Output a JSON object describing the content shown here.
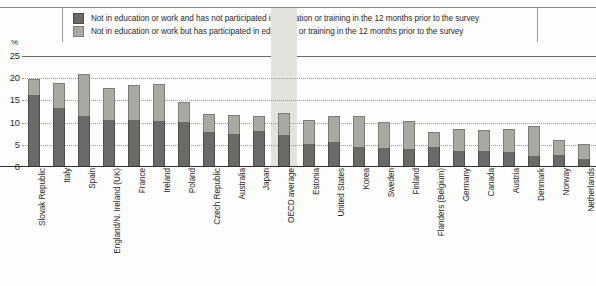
{
  "chart_data": {
    "type": "bar",
    "stacked": true,
    "title": "",
    "subtitle": "",
    "xlabel": "",
    "ylabel": "%",
    "ylim": [
      0,
      25
    ],
    "yticks": [
      0,
      5,
      10,
      15,
      20,
      25
    ],
    "grid": true,
    "legend_position": "top",
    "highlight_category": "OECD average",
    "categories": [
      "Slovak Republic",
      "Italy",
      "Spain",
      "England/N. Ireland (UK)",
      "France",
      "Ireland",
      "Poland",
      "Czech Republic",
      "Australia",
      "Japan",
      "OECD average",
      "Estonia",
      "United States",
      "Korea",
      "Sweden",
      "Finland",
      "Flanders (Belgium)",
      "Germany",
      "Canada",
      "Austria",
      "Denmark",
      "Norway",
      "Netherlands"
    ],
    "series": [
      {
        "name": "Not in education or work and  has not participated in education or training in the 12 months prior to the survey",
        "color": "#6a6a66",
        "values": [
          16.2,
          13.3,
          11.4,
          10.6,
          10.6,
          10.3,
          10.2,
          7.8,
          7.4,
          8.0,
          7.1,
          5.2,
          5.6,
          4.6,
          4.2,
          4.1,
          4.5,
          3.6,
          3.6,
          3.3,
          2.5,
          2.6,
          1.9
        ]
      },
      {
        "name": "Not in education or work but has participated in education or training in the 12 months prior to the survey",
        "color": "#a9a9a4",
        "values": [
          3.7,
          5.7,
          9.5,
          7.2,
          7.9,
          8.3,
          4.4,
          4.2,
          4.4,
          3.6,
          5.0,
          5.3,
          5.8,
          6.8,
          6.0,
          6.3,
          3.5,
          5.0,
          4.8,
          5.2,
          6.7,
          3.5,
          3.2
        ]
      }
    ],
    "totals": [
      19.9,
      19.0,
      20.9,
      17.8,
      18.5,
      18.6,
      14.6,
      12.0,
      11.8,
      11.6,
      12.1,
      10.5,
      11.4,
      11.4,
      10.2,
      10.4,
      8.0,
      8.6,
      8.4,
      8.5,
      9.2,
      6.1,
      5.1
    ]
  },
  "legend": {
    "items": [
      {
        "label": "Not in education or work and  has not participated in education or training in the 12 months prior to the survey",
        "color": "#6a6a66"
      },
      {
        "label": "Not in education or work but has participated in education or training in the 12 months prior to the survey",
        "color": "#a9a9a4"
      }
    ]
  },
  "axis": {
    "unit_label": "%",
    "y_ticks": [
      "25",
      "20",
      "15",
      "10",
      "5",
      "0"
    ]
  }
}
